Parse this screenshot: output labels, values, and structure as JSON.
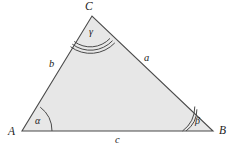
{
  "figure": {
    "type": "geometry-diagram",
    "background_color": "#ffffff",
    "fill_color": "#e7e7e7",
    "stroke_color": "#4a4a4a",
    "label_color": "#1c1c1c"
  },
  "vertices": [
    {
      "id": "A",
      "label": "A",
      "x": 22,
      "y": 131,
      "label_x": 8,
      "label_y": 128
    },
    {
      "id": "B",
      "label": "B",
      "x": 213,
      "y": 131,
      "label_x": 219,
      "label_y": 127
    },
    {
      "id": "C",
      "label": "C",
      "x": 92,
      "y": 16,
      "label_x": 85,
      "label_y": 2
    }
  ],
  "sides": [
    {
      "id": "a",
      "label": "a",
      "from": "B",
      "to": "C",
      "label_x": 144,
      "label_y": 54
    },
    {
      "id": "b",
      "label": "b",
      "from": "A",
      "to": "C",
      "label_x": 49,
      "label_y": 60
    },
    {
      "id": "c",
      "label": "c",
      "from": "A",
      "to": "B",
      "label_x": 115,
      "label_y": 136
    }
  ],
  "angles": [
    {
      "id": "alpha",
      "label": "α",
      "at_vertex": "A",
      "arc_count": 1,
      "label_x": 36,
      "label_y": 118
    },
    {
      "id": "beta",
      "label": "β",
      "at_vertex": "B",
      "arc_count": 2,
      "label_x": 195,
      "label_y": 118
    },
    {
      "id": "gamma",
      "label": "γ",
      "at_vertex": "C",
      "arc_count": 3,
      "label_x": 89,
      "label_y": 28
    }
  ]
}
